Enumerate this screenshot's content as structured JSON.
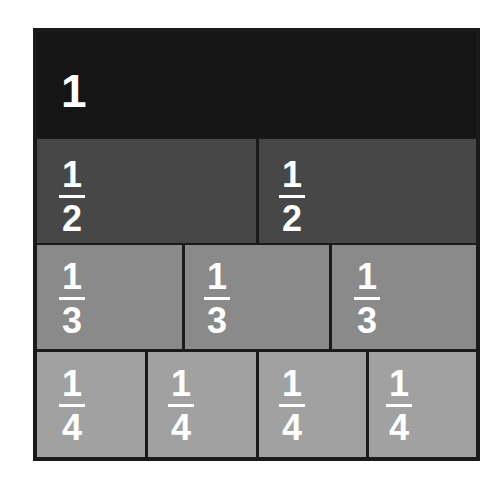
{
  "diagram": {
    "colors": {
      "border": "#1a1a1a",
      "row_whole": "#151515",
      "row_halves": "#474747",
      "row_thirds": "#8a8a8a",
      "row_quarters": "#a1a1a1",
      "text": "#ffffff"
    },
    "rows": [
      {
        "name": "whole",
        "cells": [
          {
            "label": "1"
          }
        ]
      },
      {
        "name": "halves",
        "cells": [
          {
            "numerator": "1",
            "denominator": "2"
          },
          {
            "numerator": "1",
            "denominator": "2"
          }
        ]
      },
      {
        "name": "thirds",
        "cells": [
          {
            "numerator": "1",
            "denominator": "3"
          },
          {
            "numerator": "1",
            "denominator": "3"
          },
          {
            "numerator": "1",
            "denominator": "3"
          }
        ]
      },
      {
        "name": "quarters",
        "cells": [
          {
            "numerator": "1",
            "denominator": "4"
          },
          {
            "numerator": "1",
            "denominator": "4"
          },
          {
            "numerator": "1",
            "denominator": "4"
          },
          {
            "numerator": "1",
            "denominator": "4"
          }
        ]
      }
    ]
  }
}
